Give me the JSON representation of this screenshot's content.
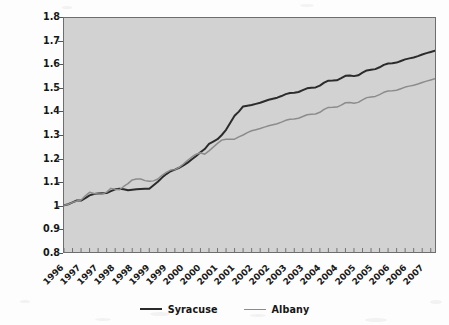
{
  "chart_data": {
    "type": "line",
    "title": "",
    "subtitle": "",
    "xlabel": "",
    "ylabel": "Index value of cumulative capital appreciation assuming an investment of $1 in 1996",
    "ylabel_lines": [
      "Index value of cumulative capital appreciation",
      "assuming an investment of $1 in 1996"
    ],
    "ylim": [
      0.8,
      1.8
    ],
    "yticks": [
      "1.8",
      "1.7",
      "1.6",
      "1.5",
      "1.4",
      "1.3",
      "1.2",
      "1.1",
      "1",
      "0.9",
      "0.8"
    ],
    "ytick_values": [
      1.8,
      1.7,
      1.6,
      1.5,
      1.4,
      1.3,
      1.2,
      1.1,
      1.0,
      0.9,
      0.8
    ],
    "grid": false,
    "legend_position": "bottom",
    "plot_background": "#d2d2d2",
    "xtick_labels": [
      "1996",
      "1997",
      "1997",
      "1998",
      "1998",
      "1999",
      "1999",
      "2000",
      "2000",
      "2001",
      "2001",
      "2002",
      "2002",
      "2003",
      "2003",
      "2004",
      "2004",
      "2005",
      "2005",
      "2006",
      "2006",
      "2007"
    ],
    "x_index": [
      0,
      1,
      2,
      3,
      4,
      5,
      6,
      7,
      8,
      9,
      10,
      11,
      12,
      13,
      14,
      15,
      16,
      17,
      18,
      19,
      20,
      21,
      22,
      23,
      24,
      25,
      26,
      27,
      28,
      29,
      30,
      31,
      32,
      33,
      34,
      35,
      36,
      37,
      38,
      39,
      40,
      41,
      42,
      43,
      44
    ],
    "series": [
      {
        "name": "Syracuse",
        "color": "#2b2b2b",
        "values": [
          1.0,
          1.004,
          1.012,
          1.02,
          1.02,
          1.03,
          1.042,
          1.048,
          1.05,
          1.051,
          1.052,
          1.06,
          1.068,
          1.07,
          1.068,
          1.064,
          1.066,
          1.068,
          1.069,
          1.07,
          1.07,
          1.085,
          1.1,
          1.118,
          1.133,
          1.145,
          1.152,
          1.16,
          1.17,
          1.182,
          1.196,
          1.21,
          1.226,
          1.24,
          1.262,
          1.272,
          1.282,
          1.3,
          1.322,
          1.352,
          1.382,
          1.4,
          1.422,
          1.425,
          1.428
        ]
      },
      {
        "name": "Albany",
        "color": "#8c8c8c",
        "values": [
          1.0,
          1.004,
          1.012,
          1.018,
          1.022,
          1.04,
          1.055,
          1.05,
          1.048,
          1.048,
          1.056,
          1.072,
          1.068,
          1.066,
          1.08,
          1.092,
          1.108,
          1.112,
          1.112,
          1.105,
          1.102,
          1.104,
          1.112,
          1.128,
          1.14,
          1.15,
          1.152,
          1.162,
          1.176,
          1.192,
          1.206,
          1.218,
          1.224,
          1.218,
          1.232,
          1.248,
          1.264,
          1.278,
          1.282,
          1.282,
          1.282,
          1.292,
          1.3,
          1.31,
          1.318
        ]
      }
    ],
    "series_tail": {
      "note": "values continue to end of 2007",
      "Syracuse_end": 1.66,
      "Albany_end": 1.54
    }
  },
  "legend": {
    "items": [
      {
        "label": "Syracuse",
        "color": "#2b2b2b"
      },
      {
        "label": "Albany",
        "color": "#8c8c8c"
      }
    ]
  }
}
